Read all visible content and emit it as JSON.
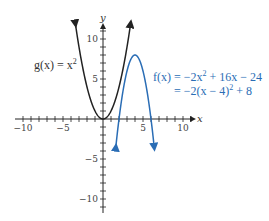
{
  "chart_data": {
    "type": "line",
    "title": "",
    "xlabel": "x",
    "ylabel": "y",
    "xlim": [
      -11,
      11.5
    ],
    "ylim": [
      -11.5,
      12
    ],
    "grid": false,
    "x_ticks": [
      -10,
      -5,
      5,
      10
    ],
    "y_ticks": [
      -10,
      -5,
      5,
      10
    ],
    "x_tick_labels": [
      "−10",
      "−5",
      "5",
      "10"
    ],
    "y_tick_labels": [
      "−10",
      "−5",
      "5",
      "10"
    ],
    "series": [
      {
        "name": "g(x) = x^2",
        "label": "g(x) = x",
        "label_sup": "2",
        "formula": "x^2",
        "color": "#222222",
        "x": [
          -3.45,
          -3,
          -2,
          -1,
          0,
          1,
          2,
          3,
          3.45
        ],
        "y": [
          11.9,
          9,
          4,
          1,
          0,
          1,
          4,
          9,
          11.9
        ]
      },
      {
        "name": "f(x) = -2x^2 + 16x - 24 = -2(x - 4)^2 + 8",
        "label_line1_prefix": "f(x) = −2x",
        "label_line1_sup": "2",
        "label_line1_suffix": " + 16x − 24",
        "label_line2_prefix": "= −2(x − 4)",
        "label_line2_sup": "2",
        "label_line2_suffix": " + 8",
        "formula": "-2(x-4)^2+8",
        "color": "#2a6db5",
        "x": [
          1.55,
          2,
          3,
          4,
          5,
          6,
          6.45
        ],
        "y": [
          -4.0,
          0,
          6,
          8,
          6,
          0,
          -4.0
        ]
      }
    ],
    "annotations": [
      "g(x) = x^2",
      "f(x) = -2x^2 + 16x - 24",
      "= -2(x - 4)^2 + 8"
    ]
  },
  "layout": {
    "origin_px": [
      103,
      119
    ],
    "px_per_unit": 8
  }
}
